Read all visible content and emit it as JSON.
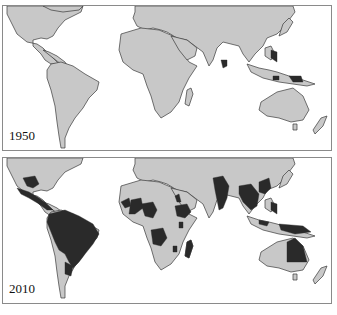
{
  "figure": {
    "panels": [
      {
        "year_label": "1950",
        "description": "World map with small dark regions (southern India / Sri Lanka, Philippines, Indonesia / New Guinea islands)"
      },
      {
        "year_label": "2010",
        "description": "World map with extensive dark regions across Mexico, Central America, South America (Brazil, Amazon), West/Central/East Africa, Madagascar, India, Southeast Asia, southern China, Philippines, Indonesia, northeastern Australia"
      }
    ],
    "colors": {
      "land": "#c8c8c8",
      "shaded_region": "#2a2a2a",
      "ocean": "#ffffff",
      "border": "#8a8a8a"
    }
  }
}
